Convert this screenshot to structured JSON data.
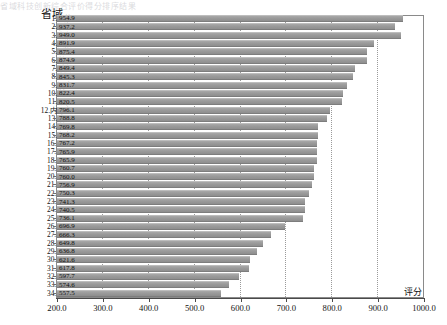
{
  "header": {
    "column_header": "省域",
    "top_artifact": "省域科技创新综合评价得分排序结果"
  },
  "axis": {
    "x_title": "评分",
    "x_ticks": [
      "200.0",
      "300.0",
      "400.0",
      "500.0",
      "600.0",
      "700.0",
      "800.0",
      "900.0",
      "1000.0"
    ],
    "x_min": 200.0,
    "x_max": 1000.0
  },
  "colors": {
    "bar_fill": "#9a9a9a",
    "bar_top": "#bdbdbd",
    "bar_bottom": "#7d7d7d",
    "frame": "#8a8a8a",
    "grid": "#9a9a9a",
    "axis": "#4a4a4a",
    "text": "#111111"
  },
  "chart_data": {
    "type": "bar",
    "orientation": "horizontal",
    "title": "",
    "subtitle": "",
    "xlabel": "评分",
    "ylabel": "省域",
    "xlim": [
      200.0,
      1000.0
    ],
    "grid": true,
    "legend": "none",
    "value_labels_inside_bars": true,
    "sorted": "descending",
    "categories": [
      "1.江苏",
      "2.北京",
      "3.广东",
      "4.安徽",
      "5.上海",
      "6.浙江",
      "7.重庆",
      "8.广西",
      "9.福建",
      "10.四川",
      "11.湖北",
      "12.内蒙古",
      "13.陕西",
      "14.宁夏",
      "15.海南",
      "16.……",
      "17.……",
      "18.……",
      "19.……",
      "20.……",
      "21.……",
      "22.……",
      "23.……",
      "24.……",
      "25.……",
      "26.……",
      "27.……",
      "28.……",
      "29.……",
      "30.……",
      "31.……",
      "32.……",
      "33.……",
      "34.……"
    ],
    "values": [
      954.9,
      937.2,
      949.0,
      891.9,
      875.4,
      874.9,
      849.4,
      845.3,
      831.7,
      822.4,
      820.5,
      796.1,
      788.8,
      769.8,
      768.2,
      767.2,
      765.9,
      765.9,
      760.7,
      760.0,
      756.9,
      750.3,
      741.3,
      740.5,
      736.1,
      696.9,
      666.3,
      649.8,
      636.8,
      621.6,
      617.8,
      597.7,
      574.6,
      557.5
    ],
    "value_labels": [
      "954.9",
      "937.2",
      "949.0",
      "891.9",
      "875.4",
      "874.9",
      "849.4",
      "845.3",
      "831.7",
      "822.4",
      "820.5",
      "796.1",
      "788.8",
      "769.8",
      "768.2",
      "767.2",
      "765.9",
      "765.9",
      "760.7",
      "760.0",
      "756.9",
      "750.3",
      "741.3",
      "740.5",
      "736.1",
      "696.9",
      "666.3",
      "649.8",
      "636.8",
      "621.6",
      "617.8",
      "597.7",
      "574.6",
      "557.5"
    ]
  }
}
